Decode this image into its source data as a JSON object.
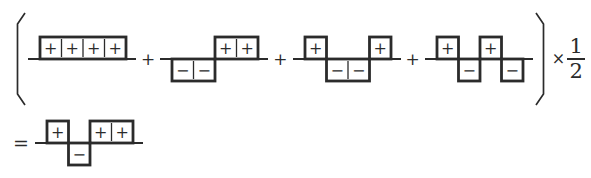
{
  "figure": {
    "background": "#ffffff",
    "ink": "#2b2b2b",
    "icons": {
      "open_paren": "(",
      "close_paren": ")"
    },
    "plus_operator": "+",
    "times_operator": "×",
    "equals_sign": "=",
    "fraction": {
      "numerator": "1",
      "denominator": "2"
    },
    "cell_symbols": {
      "plus": "+",
      "minus": "−"
    },
    "terms": [
      {
        "id": "term-1",
        "signs": [
          "+",
          "+",
          "+",
          "+"
        ]
      },
      {
        "id": "term-2",
        "signs": [
          "-",
          "-",
          "+",
          "+"
        ]
      },
      {
        "id": "term-3",
        "signs": [
          "+",
          "-",
          "-",
          "+"
        ]
      },
      {
        "id": "term-4",
        "signs": [
          "+",
          "-",
          "+",
          "-"
        ]
      }
    ],
    "result": {
      "id": "result",
      "signs": [
        "+",
        "-",
        "+",
        "+"
      ]
    }
  }
}
